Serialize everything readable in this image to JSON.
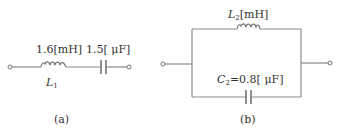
{
  "colors": {
    "wire": "#8a8a8a",
    "text": "#333333",
    "background": "#ffffff"
  },
  "circuit_a": {
    "caption": "(a)",
    "inductor": {
      "name": "L",
      "subscript": "1",
      "value_label": "1.6[mH]"
    },
    "capacitor": {
      "value_label": "1.5[ μF]"
    },
    "topology": "series"
  },
  "circuit_b": {
    "caption": "(b)",
    "inductor": {
      "name": "L",
      "subscript": "2",
      "unit_label": "[mH]"
    },
    "capacitor": {
      "name": "C",
      "subscript": "2",
      "value_label": "=0.8[ μF]"
    },
    "topology": "parallel"
  }
}
